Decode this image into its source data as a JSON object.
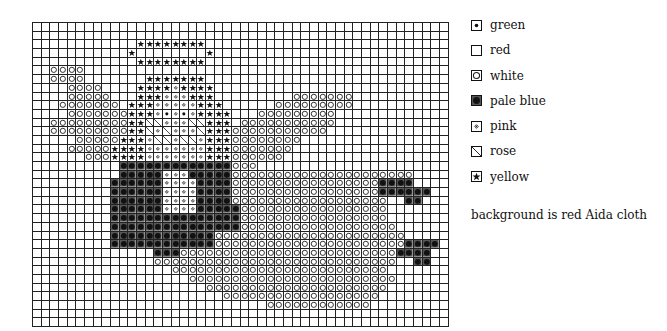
{
  "legend": {
    "items": [
      {
        "key": "G",
        "label": "green",
        "symbol": "dot-icon"
      },
      {
        "key": "R0",
        "label": "red",
        "symbol": "empty-square-icon"
      },
      {
        "key": "W",
        "label": "white",
        "symbol": "circle-icon"
      },
      {
        "key": "B",
        "label": "pale blue",
        "symbol": "filled-dot-icon"
      },
      {
        "key": "P",
        "label": "pink",
        "symbol": "small-diamond-icon"
      },
      {
        "key": "R",
        "label": "rose",
        "symbol": "diagonal-slash-icon"
      },
      {
        "key": "Y",
        "label": "yellow",
        "symbol": "star-icon"
      }
    ],
    "note": "background is red Aida cloth"
  },
  "chart_data": {
    "type": "cross-stitch-pattern",
    "title": "",
    "columns": 48,
    "rows": 35,
    "key": {
      ".": "red (background)",
      "G": "green",
      "W": "white",
      "B": "pale blue",
      "P": "pink",
      "R": "rose",
      "Y": "yellow"
    },
    "grid": [
      "................................................",
      "................................................",
      "............YYYYYYYY............................",
      "...........Y........Y...........................",
      "............YYYYYYYY............................",
      "..WWWW..........................................",
      "..WWWW.......YYYYYYY............................",
      "....WWWW....YYYYPYYYY...........................",
      "....WWWWW...YYYPPPYYY.........WWWWWWW...........",
      "...WWWWWWW.YYYPPPPPYYY......WWWWWWWWW...........",
      "....WWWWWWWYYYPGPGPYYYY...WWWWWWWWW.............",
      "..WWWWWWWWWYYRRPPPRRYYY.WWWWWWWWWWW.............",
      "..WWWWWWWWWYYRPRPPPRYYYWWWWWWWWWWW..............",
      ".....WWWWWYYYPRRPRRPYYYWWWWWWWW.................",
      "....WWWWWYYYYPPPPPPPYYYWWWWWWW..................",
      "......WWWYYYYPPPPPPPYYYWWWWWW...................",
      "..........BBBBBBBBBBBBBWWW......................",
      "..........BBBBBPPPBBBBBWWWWWWWWWWWWWWWWWWWWW....",
      ".........BBBBBBPPPPBBBBWWWWWWWWWWWWWWWWWBBBB....",
      ".........BBBBBBPPPPBBBBWWWWWWWWWWWWWWWWWBBBBBB..",
      ".........BBBBBBPPPPBBBBWWWWWWWWWWWWWWWWWW..BB...",
      ".........BBBBBBPPPPBBBBBWWWWWWWWWWWWWWWWW.......",
      ".........BBBBBBBBBBBBBBBWWWWWWWWWWWWWWWWW.......",
      ".........BBBBBBBBBBBBBBBWWWWWWWWWWWWWWWWWW......",
      ".........BBBBBBBBBBBBWWWWWWWWWWWWWWWWWWWWWW.....",
      ".........BBBBBBBBBBBBWWWWWWWWWWWWWWWWWWWWWWBBBB.",
      "..............BBBWWWWWWWWWWWWWWWWWWWWWWWWWBBBB.",
      "..............WWWWWWWWWWWWWWWWWWWWWWWWWWWW..BB..",
      "................WWWWWWWWWWWWWWWWWWWWWWWWW.......",
      "..................WWWWWWWWWWWWWWWWWWWWWWWW......",
      "....................WWWWWWWWWWWWWWWWWWWWW.......",
      "......................WWWWWWWWWWWWWWWWWW........",
      "...........................WWWWWWWWWWWW.........",
      "................................................",
      "................................................"
    ]
  }
}
